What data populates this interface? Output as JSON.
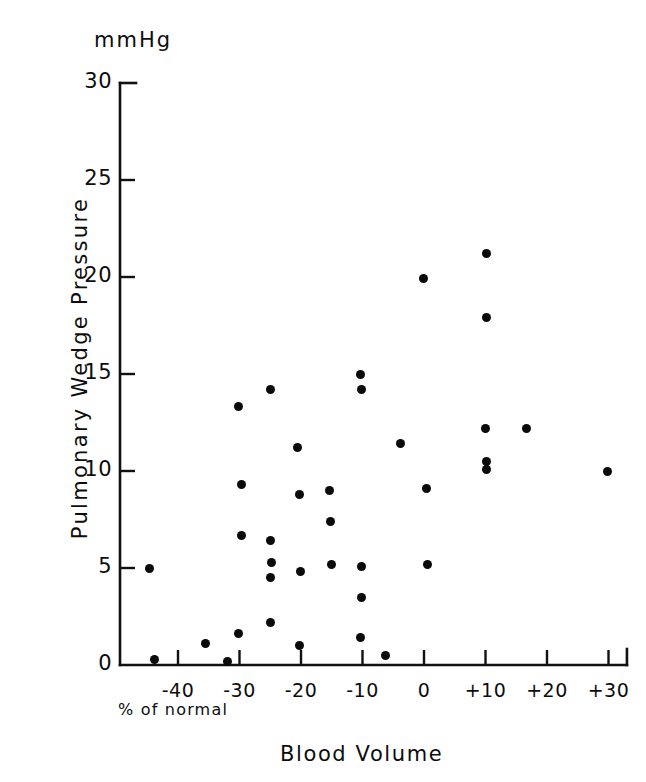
{
  "chart_data": {
    "type": "scatter",
    "title": "",
    "xlabel": "Blood Volume",
    "xlabel_sub": "% of normal",
    "ylabel": "Pulmonary Wedge Pressure",
    "yunit": "mmHg",
    "xlim": [
      -45.5,
      33.0
    ],
    "ylim": [
      0,
      30
    ],
    "xticks": [
      -40,
      -30,
      -20,
      -10,
      0,
      10,
      20,
      30
    ],
    "xtick_labels": [
      "-40",
      "-30",
      "-20",
      "-10",
      "0",
      "+10",
      "+20",
      "+30"
    ],
    "yticks": [
      0,
      5,
      10,
      15,
      20,
      25,
      30
    ],
    "ytick_labels": [
      "0",
      "5",
      "10",
      "15",
      "20",
      "25",
      "30"
    ],
    "grid": false,
    "legend": null,
    "marker_color": "#0a0a0a",
    "axis_color": "#111111",
    "points": [
      {
        "x": -44.6,
        "y": 5.0
      },
      {
        "x": -43.9,
        "y": 0.3
      },
      {
        "x": -35.6,
        "y": 1.1
      },
      {
        "x": -32.0,
        "y": 0.2
      },
      {
        "x": -30.1,
        "y": 13.3
      },
      {
        "x": -29.6,
        "y": 9.3
      },
      {
        "x": -29.7,
        "y": 6.7
      },
      {
        "x": -30.2,
        "y": 1.6
      },
      {
        "x": -25.0,
        "y": 14.2
      },
      {
        "x": -24.9,
        "y": 6.4
      },
      {
        "x": -24.8,
        "y": 5.3
      },
      {
        "x": -24.9,
        "y": 4.5
      },
      {
        "x": -24.9,
        "y": 2.2
      },
      {
        "x": -20.6,
        "y": 11.2
      },
      {
        "x": -20.2,
        "y": 8.8
      },
      {
        "x": -20.1,
        "y": 4.8
      },
      {
        "x": -20.3,
        "y": 1.0
      },
      {
        "x": -15.3,
        "y": 9.0
      },
      {
        "x": -15.2,
        "y": 7.4
      },
      {
        "x": -15.1,
        "y": 5.2
      },
      {
        "x": -10.3,
        "y": 15.0
      },
      {
        "x": -10.2,
        "y": 14.2
      },
      {
        "x": -10.1,
        "y": 5.1
      },
      {
        "x": -10.2,
        "y": 3.5
      },
      {
        "x": -10.4,
        "y": 1.4
      },
      {
        "x": -6.2,
        "y": 0.5
      },
      {
        "x": -3.8,
        "y": 11.4
      },
      {
        "x": -0.1,
        "y": 19.9
      },
      {
        "x": 0.4,
        "y": 9.1
      },
      {
        "x": 0.6,
        "y": 5.2
      },
      {
        "x": 10.2,
        "y": 21.2
      },
      {
        "x": 10.1,
        "y": 17.9
      },
      {
        "x": 10.0,
        "y": 12.2
      },
      {
        "x": 10.1,
        "y": 10.5
      },
      {
        "x": 10.1,
        "y": 10.1
      },
      {
        "x": 16.6,
        "y": 12.2
      },
      {
        "x": 29.8,
        "y": 10.0
      }
    ]
  },
  "geometry": {
    "x0_px": 120.0,
    "x_per_unit": 6.15,
    "x_origin_unit": 0,
    "x_origin_px": 424.0,
    "y0_px": 665.0,
    "y_per_unit": 19.4
  }
}
